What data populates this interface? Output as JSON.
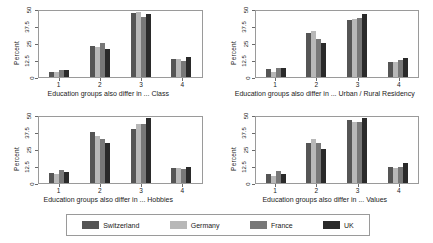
{
  "chart_data": {
    "type": "bar",
    "title": "",
    "panel_layout": "2x2",
    "legend_position": "bottom",
    "grid": false,
    "ylabel": "Percent",
    "ylim": [
      0,
      50
    ],
    "yticks": [
      "0",
      "12.5",
      "25",
      "37.5",
      "50"
    ],
    "ytick_values": [
      0,
      12.5,
      25,
      37.5,
      50
    ],
    "xlabel_prefix": "Education groups also differ in ...",
    "categories": [
      "1",
      "2",
      "3",
      "4"
    ],
    "series_names": [
      "Switzerland",
      "Germany",
      "France",
      "UK"
    ],
    "series_colors": [
      "#555555",
      "#b8b8b8",
      "#787878",
      "#2a2a2a"
    ],
    "panels": [
      {
        "id": "class",
        "xlabel": "Education groups also differ in ... Class",
        "topic": "Class",
        "series": [
          {
            "name": "Switzerland",
            "color": "#555555",
            "values": [
              4.0,
              23.5,
              48.5,
              14.0
            ]
          },
          {
            "name": "Germany",
            "color": "#b8b8b8",
            "values": [
              3.5,
              23.0,
              49.5,
              13.5
            ]
          },
          {
            "name": "France",
            "color": "#787878",
            "values": [
              5.5,
              26.0,
              45.5,
              12.0
            ]
          },
          {
            "name": "UK",
            "color": "#2a2a2a",
            "values": [
              5.0,
              21.5,
              47.5,
              15.5
            ]
          }
        ]
      },
      {
        "id": "urban-rural-residency",
        "xlabel": "Education groups also differ in ... Urban / Rural Residency",
        "topic": "Urban / Rural Residency",
        "series": [
          {
            "name": "Switzerland",
            "color": "#555555",
            "values": [
              6.0,
              33.0,
              43.5,
              11.5
            ]
          },
          {
            "name": "Germany",
            "color": "#b8b8b8",
            "values": [
              4.0,
              34.5,
              44.0,
              11.5
            ]
          },
          {
            "name": "France",
            "color": "#787878",
            "values": [
              6.5,
              28.5,
              44.5,
              13.0
            ]
          },
          {
            "name": "UK",
            "color": "#2a2a2a",
            "values": [
              6.5,
              25.5,
              47.5,
              14.5
            ]
          }
        ]
      },
      {
        "id": "hobbies",
        "xlabel": "Education groups also differ in ... Hobbies",
        "topic": "Hobbies",
        "series": [
          {
            "name": "Switzerland",
            "color": "#555555",
            "values": [
              7.5,
              38.5,
              41.0,
              11.0
            ]
          },
          {
            "name": "Germany",
            "color": "#b8b8b8",
            "values": [
              6.5,
              35.5,
              44.5,
              11.5
            ]
          },
          {
            "name": "France",
            "color": "#787878",
            "values": [
              9.5,
              33.0,
              44.5,
              10.5
            ]
          },
          {
            "name": "UK",
            "color": "#2a2a2a",
            "values": [
              8.0,
              30.5,
              49.0,
              12.5
            ]
          }
        ]
      },
      {
        "id": "values",
        "xlabel": "Education groups also differ in ... Values",
        "topic": "Values",
        "series": [
          {
            "name": "Switzerland",
            "color": "#555555",
            "values": [
              6.5,
              30.5,
              48.0,
              12.0
            ]
          },
          {
            "name": "Germany",
            "color": "#b8b8b8",
            "values": [
              5.5,
              33.0,
              46.5,
              11.5
            ]
          },
          {
            "name": "France",
            "color": "#787878",
            "values": [
              9.0,
              30.0,
              46.5,
              12.0
            ]
          },
          {
            "name": "UK",
            "color": "#2a2a2a",
            "values": [
              6.5,
              26.0,
              49.0,
              15.0
            ]
          }
        ]
      }
    ]
  },
  "legend": {
    "items": [
      {
        "label": "Switzerland",
        "color": "#555555"
      },
      {
        "label": "Germany",
        "color": "#b8b8b8"
      },
      {
        "label": "France",
        "color": "#787878"
      },
      {
        "label": "UK",
        "color": "#2a2a2a"
      }
    ]
  }
}
